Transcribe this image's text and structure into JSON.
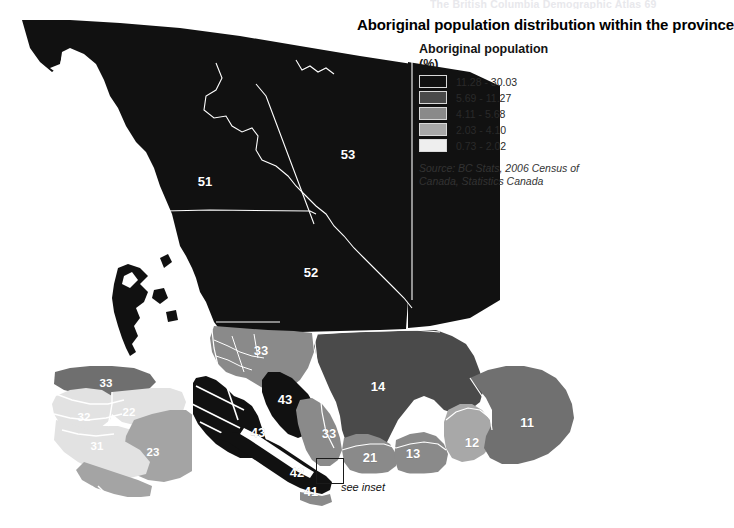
{
  "header": {
    "running_text": "The British Columbia Demographic Atlas    69"
  },
  "title": "Aboriginal population distribution within the province",
  "legend": {
    "title": "Aboriginal population",
    "unit": "(%)",
    "classes": [
      {
        "label": "11.28 - 30.03",
        "color": "#111111"
      },
      {
        "label": "5.69 - 11.27",
        "color": "#4a4a4a"
      },
      {
        "label": "4.11 - 5.68",
        "color": "#8a8a8a"
      },
      {
        "label": "2.03 - 4.10",
        "color": "#a8a8a8"
      },
      {
        "label": "0.73 - 2.02",
        "color": "#eeeeee"
      }
    ]
  },
  "source": "Source: BC Stats, 2006 Census of Canada, Statistics Canada",
  "inset_caption": "see inset",
  "map": {
    "region_labels": [
      {
        "id": "51",
        "text": "51",
        "x": 205,
        "y": 186,
        "fill": "#ffffff"
      },
      {
        "id": "53",
        "text": "53",
        "x": 348,
        "y": 159,
        "fill": "#ffffff"
      },
      {
        "id": "52",
        "text": "52",
        "x": 311,
        "y": 277,
        "fill": "#ffffff"
      },
      {
        "id": "33-north",
        "text": "33",
        "x": 261,
        "y": 355,
        "fill": "#ffffff"
      },
      {
        "id": "43-north",
        "text": "43",
        "x": 285,
        "y": 404,
        "fill": "#ffffff"
      },
      {
        "id": "43-coast",
        "text": "43",
        "x": 258,
        "y": 437,
        "fill": "#ffffff"
      },
      {
        "id": "33-south",
        "text": "33",
        "x": 329,
        "y": 438,
        "fill": "#ffffff"
      },
      {
        "id": "14",
        "text": "14",
        "x": 378,
        "y": 391,
        "fill": "#ffffff"
      },
      {
        "id": "11",
        "text": "11",
        "x": 527,
        "y": 427,
        "fill": "#ffffff"
      },
      {
        "id": "12",
        "text": "12",
        "x": 472,
        "y": 447,
        "fill": "#ffffff"
      },
      {
        "id": "13",
        "text": "13",
        "x": 413,
        "y": 458,
        "fill": "#ffffff"
      },
      {
        "id": "21",
        "text": "21",
        "x": 370,
        "y": 462,
        "fill": "#ffffff"
      },
      {
        "id": "42",
        "text": "42",
        "x": 297,
        "y": 477,
        "fill": "#ffffff"
      },
      {
        "id": "41",
        "text": "41",
        "x": 311,
        "y": 496,
        "fill": "#ffffff"
      }
    ],
    "inset_labels": [
      {
        "id": "inset-33",
        "text": "33",
        "x": 106,
        "y": 387,
        "fill": "#ffffff"
      },
      {
        "id": "inset-32",
        "text": "32",
        "x": 84,
        "y": 421,
        "fill": "#ffffff"
      },
      {
        "id": "inset-22",
        "text": "22",
        "x": 129,
        "y": 416,
        "fill": "#ffffff"
      },
      {
        "id": "inset-31",
        "text": "31",
        "x": 97,
        "y": 450,
        "fill": "#ffffff"
      },
      {
        "id": "inset-23",
        "text": "23",
        "x": 153,
        "y": 456,
        "fill": "#ffffff"
      }
    ]
  },
  "colors": {
    "background": "#ffffff",
    "class1": "#111111",
    "class2": "#4a4a4a",
    "class3": "#8a8a8a",
    "class4": "#a8a8a8",
    "class5": "#eeeeee",
    "boundary": "#ffffff",
    "inset_border": "#1a1a1a"
  }
}
